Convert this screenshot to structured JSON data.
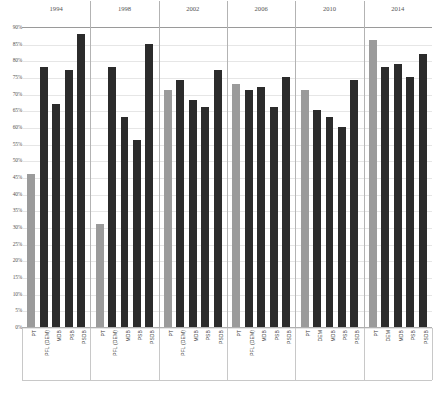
{
  "chart_data": {
    "type": "bar",
    "title": "",
    "xlabel": "",
    "ylabel": "",
    "ylim": [
      0,
      90
    ],
    "grid": true,
    "legend": "none",
    "ytick_labels": [
      "90%",
      "85%",
      "80%",
      "75%",
      "70%",
      "65%",
      "60%",
      "55%",
      "50%",
      "45%",
      "40%",
      "35%",
      "30%",
      "25%",
      "20%",
      "15%",
      "10%",
      "5%",
      "0%"
    ],
    "ytick_values": [
      90,
      85,
      80,
      75,
      70,
      65,
      60,
      55,
      50,
      45,
      40,
      35,
      30,
      25,
      20,
      15,
      10,
      5,
      0
    ],
    "group_labels": [
      "1994",
      "1998",
      "2002",
      "2006",
      "2010",
      "2014"
    ],
    "categories": [
      "PT",
      "PFL (DEM)",
      "MDB",
      "PSB",
      "PSDB"
    ],
    "colors": {
      "pt": "#9b9b9b",
      "other": "#2b2b2b"
    },
    "groups": [
      {
        "year": "1994",
        "bars": [
          {
            "label": "PT",
            "value": 46,
            "color_key": "pt"
          },
          {
            "label": "PFL (DEM)",
            "value": 78,
            "color_key": "other"
          },
          {
            "label": "MDB",
            "value": 67,
            "color_key": "other"
          },
          {
            "label": "PSB",
            "value": 77,
            "color_key": "other"
          },
          {
            "label": "PSDB",
            "value": 88,
            "color_key": "other"
          }
        ]
      },
      {
        "year": "1998",
        "bars": [
          {
            "label": "PT",
            "value": 31,
            "color_key": "pt"
          },
          {
            "label": "PFL (DEM)",
            "value": 78,
            "color_key": "other"
          },
          {
            "label": "MDB",
            "value": 63,
            "color_key": "other"
          },
          {
            "label": "PSB",
            "value": 56,
            "color_key": "other"
          },
          {
            "label": "PSDB",
            "value": 85,
            "color_key": "other"
          }
        ]
      },
      {
        "year": "2002",
        "bars": [
          {
            "label": "PT",
            "value": 71,
            "color_key": "pt"
          },
          {
            "label": "PFL (DEM)",
            "value": 74,
            "color_key": "other"
          },
          {
            "label": "MDB",
            "value": 68,
            "color_key": "other"
          },
          {
            "label": "PSB",
            "value": 66,
            "color_key": "other"
          },
          {
            "label": "PSDB",
            "value": 77,
            "color_key": "other"
          }
        ]
      },
      {
        "year": "2006",
        "bars": [
          {
            "label": "PT",
            "value": 73,
            "color_key": "pt"
          },
          {
            "label": "PFL (DEM)",
            "value": 71,
            "color_key": "other"
          },
          {
            "label": "MDB",
            "value": 72,
            "color_key": "other"
          },
          {
            "label": "PSB",
            "value": 66,
            "color_key": "other"
          },
          {
            "label": "PSDB",
            "value": 75,
            "color_key": "other"
          }
        ]
      },
      {
        "year": "2010",
        "bars": [
          {
            "label": "PT",
            "value": 71,
            "color_key": "pt"
          },
          {
            "label": "DEM",
            "value": 65,
            "color_key": "other"
          },
          {
            "label": "MDB",
            "value": 63,
            "color_key": "other"
          },
          {
            "label": "PSB",
            "value": 60,
            "color_key": "other"
          },
          {
            "label": "PSDB",
            "value": 74,
            "color_key": "other"
          }
        ]
      },
      {
        "year": "2014",
        "bars": [
          {
            "label": "PT",
            "value": 86,
            "color_key": "pt"
          },
          {
            "label": "DEM",
            "value": 78,
            "color_key": "other"
          },
          {
            "label": "MDB",
            "value": 79,
            "color_key": "other"
          },
          {
            "label": "PSB",
            "value": 75,
            "color_key": "other"
          },
          {
            "label": "PSDB",
            "value": 82,
            "color_key": "other"
          }
        ]
      }
    ]
  },
  "caption": ""
}
